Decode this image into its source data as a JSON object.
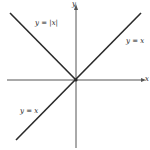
{
  "diagram": {
    "title": "",
    "axes": {
      "x_label": "x",
      "y_label": "y"
    },
    "labels": {
      "abs": "y = |x|",
      "line_upper": "y = x",
      "line_lower": "y = x"
    },
    "colors": {
      "axis": "#555555",
      "curve": "#2a2a2a",
      "background": "#ffffff"
    }
  }
}
